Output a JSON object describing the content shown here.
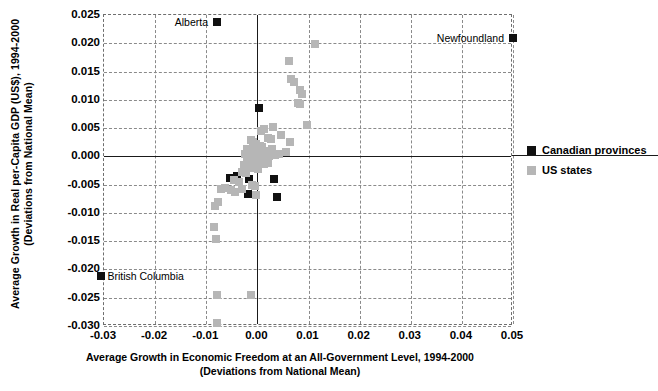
{
  "chart_data": {
    "type": "scatter",
    "title": "",
    "xlabel": "Average Growth in Economic Freedom at an All-Government Level, 1994-2000",
    "xlabel_line2": "(Deviations from National Mean)",
    "ylabel": "Average Growth in Real per-Capita GDP (US$), 1994-2000",
    "ylabel_line2": "(Deviations from National Mean)",
    "xlim": [
      -0.03,
      0.05
    ],
    "ylim": [
      -0.03,
      0.025
    ],
    "xticks": [
      "-0.03",
      "-0.02",
      "-0.01",
      "0.00",
      "0.01",
      "0.02",
      "0.03",
      "0.04",
      "0.05"
    ],
    "xtick_values": [
      -0.03,
      -0.02,
      -0.01,
      0.0,
      0.01,
      0.02,
      0.03,
      0.04,
      0.05
    ],
    "yticks": [
      "0.025",
      "0.020",
      "0.015",
      "0.010",
      "0.005",
      "0.000",
      "-0.005",
      "-0.010",
      "-0.015",
      "-0.020",
      "-0.025",
      "-0.030"
    ],
    "ytick_values": [
      0.025,
      0.02,
      0.015,
      0.01,
      0.005,
      0.0,
      -0.005,
      -0.01,
      -0.015,
      -0.02,
      -0.025,
      -0.03
    ],
    "grid": true,
    "legend_position": "right",
    "colors": {
      "canadian_provinces": "#111111",
      "us_states": "#b6b6b6"
    },
    "series": [
      {
        "name": "Canadian provinces",
        "marker": "square",
        "color": "#111111",
        "points": [
          [
            -0.0079,
            0.0238
          ],
          [
            0.05,
            0.021
          ],
          [
            0.0003,
            0.0085
          ],
          [
            -0.0053,
            -0.0038
          ],
          [
            -0.004,
            -0.0035
          ],
          [
            -0.0016,
            -0.004
          ],
          [
            0.0032,
            -0.004
          ],
          [
            -0.0018,
            -0.0066
          ],
          [
            0.0039,
            -0.0072
          ],
          [
            -0.0305,
            -0.0212
          ]
        ]
      },
      {
        "name": "US states",
        "marker": "square",
        "color": "#b6b6b6",
        "points": [
          [
            0.0113,
            0.0198
          ],
          [
            0.0062,
            0.0168
          ],
          [
            0.0066,
            0.0137
          ],
          [
            0.0071,
            0.0131
          ],
          [
            0.0084,
            0.0118
          ],
          [
            0.0088,
            0.0111
          ],
          [
            0.0079,
            0.0095
          ],
          [
            0.0084,
            0.0092
          ],
          [
            0.0097,
            0.0055
          ],
          [
            0.003,
            0.0052
          ],
          [
            0.0013,
            0.0048
          ],
          [
            0.0008,
            0.0044
          ],
          [
            0.0047,
            0.0038
          ],
          [
            0.002,
            0.0032
          ],
          [
            0.0026,
            0.003
          ],
          [
            0.0063,
            0.0025
          ],
          [
            -0.0013,
            0.0029
          ],
          [
            -0.0009,
            0.0026
          ],
          [
            -0.0002,
            0.0022
          ],
          [
            0.0006,
            0.0019
          ],
          [
            0.001,
            0.0017
          ],
          [
            -0.002,
            0.0013
          ],
          [
            -0.0012,
            0.0011
          ],
          [
            -0.0005,
            0.001
          ],
          [
            0.0001,
            0.0008
          ],
          [
            0.0008,
            0.0007
          ],
          [
            0.0015,
            0.0006
          ],
          [
            0.0022,
            0.001
          ],
          [
            0.0029,
            0.0013
          ],
          [
            -0.0024,
            0.0004
          ],
          [
            -0.0017,
            0.0003
          ],
          [
            -0.001,
            0.0002
          ],
          [
            -0.0004,
            0.0001
          ],
          [
            0.0002,
            0.0
          ],
          [
            0.0009,
            -0.0001
          ],
          [
            0.0016,
            0.0001
          ],
          [
            0.0023,
            0.0
          ],
          [
            0.0034,
            0.0002
          ],
          [
            0.0042,
            0.0004
          ],
          [
            0.0056,
            0.0007
          ],
          [
            -0.0021,
            -0.0007
          ],
          [
            -0.0014,
            -0.0008
          ],
          [
            -0.0007,
            -0.001
          ],
          [
            0.0,
            -0.0009
          ],
          [
            0.0007,
            -0.0012
          ],
          [
            0.0013,
            -0.0014
          ],
          [
            0.002,
            -0.0011
          ],
          [
            -0.0027,
            -0.0016
          ],
          [
            -0.0019,
            -0.0018
          ],
          [
            -0.0009,
            -0.002
          ],
          [
            0.0002,
            -0.0022
          ],
          [
            -0.003,
            -0.0028
          ],
          [
            -0.0023,
            -0.003
          ],
          [
            -0.0046,
            -0.0042
          ],
          [
            -0.0036,
            -0.0046
          ],
          [
            -0.0064,
            -0.0056
          ],
          [
            -0.0072,
            -0.0058
          ],
          [
            -0.0052,
            -0.006
          ],
          [
            -0.0044,
            -0.0063
          ],
          [
            -0.003,
            -0.0058
          ],
          [
            -0.0011,
            -0.005
          ],
          [
            -0.0005,
            -0.0052
          ],
          [
            -0.0002,
            -0.0068
          ],
          [
            -0.0077,
            -0.008
          ],
          [
            -0.0082,
            -0.0088
          ],
          [
            -0.0085,
            -0.0125
          ],
          [
            -0.008,
            -0.0146
          ],
          [
            -0.0079,
            -0.0245
          ],
          [
            -0.0013,
            -0.0245
          ],
          [
            -0.0079,
            -0.0295
          ]
        ]
      }
    ],
    "annotations": [
      {
        "text": "Alberta",
        "x": -0.0079,
        "y": 0.0238,
        "align": "right"
      },
      {
        "text": "Newfoundland",
        "x": 0.05,
        "y": 0.021,
        "align": "right"
      },
      {
        "text": "British Columbia",
        "x": -0.0305,
        "y": -0.0212,
        "align": "left"
      }
    ]
  },
  "legend": {
    "items": [
      {
        "label": "Canadian provinces",
        "color": "#111111"
      },
      {
        "label": "US states",
        "color": "#b6b6b6"
      }
    ]
  }
}
